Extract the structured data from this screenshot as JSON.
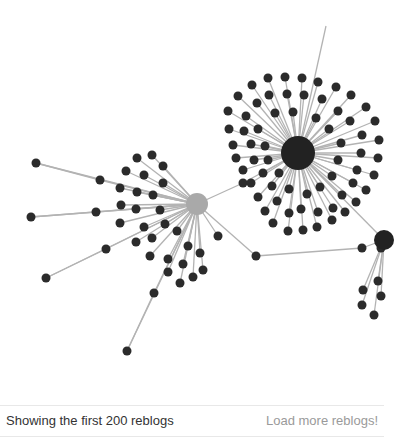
{
  "footer": {
    "status_text": "Showing the first 200 reblogs",
    "load_more_label": "Load more reblogs!"
  },
  "colors": {
    "edge": "#b3b3b3",
    "node": "#2b2b2b",
    "main_hub": "#222222",
    "origin_hub": "#a9a9a9",
    "status_text": "#333333",
    "load_more_text": "#9a9a9a"
  },
  "graph": {
    "hubs": [
      {
        "id": "main",
        "x": 298,
        "y": 153,
        "r": 17,
        "color": "#222222"
      },
      {
        "id": "origin",
        "x": 197,
        "y": 204,
        "r": 11,
        "color": "#a9a9a9"
      },
      {
        "id": "right",
        "x": 384,
        "y": 240,
        "r": 10,
        "color": "#222222"
      }
    ],
    "hub_edges": [
      {
        "from": [
          197,
          204
        ],
        "via": [
          243,
          183
        ],
        "to": [
          298,
          153
        ]
      },
      {
        "from": [
          197,
          204
        ],
        "via": [
          256,
          256
        ],
        "to": [
          362,
          248
        ]
      },
      {
        "from": [
          362,
          248
        ],
        "to": [
          384,
          240
        ]
      },
      {
        "from": [
          298,
          153
        ],
        "to": [
          384,
          240
        ]
      },
      {
        "from": [
          298,
          153
        ],
        "to": [
          326,
          26
        ]
      }
    ],
    "main_satellites": [
      [
        268,
        78
      ],
      [
        285,
        77
      ],
      [
        302,
        78
      ],
      [
        318,
        82
      ],
      [
        336,
        87
      ],
      [
        351,
        95
      ],
      [
        366,
        107
      ],
      [
        375,
        121
      ],
      [
        379,
        140
      ],
      [
        378,
        158
      ],
      [
        374,
        175
      ],
      [
        366,
        190
      ],
      [
        356,
        202
      ],
      [
        345,
        212
      ],
      [
        332,
        220
      ],
      [
        317,
        227
      ],
      [
        303,
        230
      ],
      [
        288,
        231
      ],
      [
        273,
        223
      ],
      [
        265,
        211
      ],
      [
        258,
        197
      ],
      [
        251,
        183
      ],
      [
        243,
        170
      ],
      [
        236,
        158
      ],
      [
        233,
        145
      ],
      [
        229,
        129
      ],
      [
        228,
        111
      ],
      [
        238,
        96
      ],
      [
        252,
        85
      ],
      [
        269,
        95
      ],
      [
        287,
        94
      ],
      [
        304,
        95
      ],
      [
        322,
        99
      ],
      [
        338,
        111
      ],
      [
        350,
        121
      ],
      [
        362,
        135
      ],
      [
        361,
        153
      ],
      [
        357,
        170
      ],
      [
        353,
        183
      ],
      [
        342,
        195
      ],
      [
        333,
        208
      ],
      [
        318,
        212
      ],
      [
        301,
        209
      ],
      [
        289,
        213
      ],
      [
        277,
        201
      ],
      [
        272,
        186
      ],
      [
        263,
        173
      ],
      [
        254,
        160
      ],
      [
        251,
        144
      ],
      [
        244,
        131
      ],
      [
        246,
        116
      ],
      [
        257,
        103
      ],
      [
        275,
        113
      ],
      [
        293,
        112
      ],
      [
        316,
        118
      ],
      [
        329,
        129
      ],
      [
        341,
        143
      ],
      [
        338,
        160
      ],
      [
        332,
        176
      ],
      [
        320,
        187
      ],
      [
        307,
        194
      ],
      [
        289,
        189
      ],
      [
        279,
        173
      ],
      [
        268,
        160
      ],
      [
        265,
        146
      ],
      [
        258,
        129
      ]
    ],
    "origin_satellites": [
      [
        36,
        163
      ],
      [
        100,
        180
      ],
      [
        31,
        217
      ],
      [
        96,
        212
      ],
      [
        46,
        278
      ],
      [
        106,
        249
      ],
      [
        127,
        351
      ],
      [
        154,
        293
      ],
      [
        137,
        158
      ],
      [
        152,
        155
      ],
      [
        163,
        166
      ],
      [
        126,
        171
      ],
      [
        144,
        175
      ],
      [
        163,
        183
      ],
      [
        120,
        188
      ],
      [
        137,
        192
      ],
      [
        153,
        195
      ],
      [
        121,
        205
      ],
      [
        136,
        209
      ],
      [
        160,
        210
      ],
      [
        120,
        223
      ],
      [
        144,
        227
      ],
      [
        165,
        224
      ],
      [
        136,
        242
      ],
      [
        152,
        238
      ],
      [
        177,
        231
      ],
      [
        150,
        256
      ],
      [
        168,
        259
      ],
      [
        188,
        246
      ],
      [
        168,
        272
      ],
      [
        183,
        264
      ],
      [
        200,
        253
      ],
      [
        180,
        283
      ],
      [
        193,
        277
      ],
      [
        203,
        270
      ],
      [
        218,
        236
      ]
    ],
    "right_satellites": [
      [
        381,
        248
      ],
      [
        378,
        281
      ],
      [
        363,
        290
      ],
      [
        381,
        296
      ],
      [
        362,
        305
      ],
      [
        374,
        315
      ]
    ]
  }
}
